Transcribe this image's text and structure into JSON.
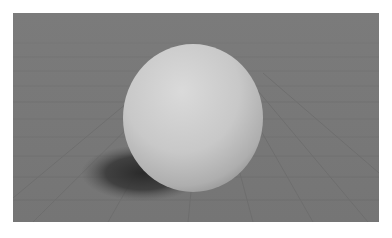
{
  "scene": {
    "subject": "white sphere resting on a gray grid floor",
    "background_color": "#7a7a7a",
    "floor_line_color": "#6c6c6c",
    "sphere": {
      "cx": 180,
      "cy": 105,
      "rx": 70,
      "ry": 74,
      "highlight_color": "#d9d9d9",
      "mid_color": "#c6c6c6",
      "shade_color": "#9a9a9a"
    },
    "shadow": {
      "cx": 130,
      "cy": 160,
      "rx": 62,
      "ry": 28,
      "color": "#2a2a2a"
    }
  }
}
